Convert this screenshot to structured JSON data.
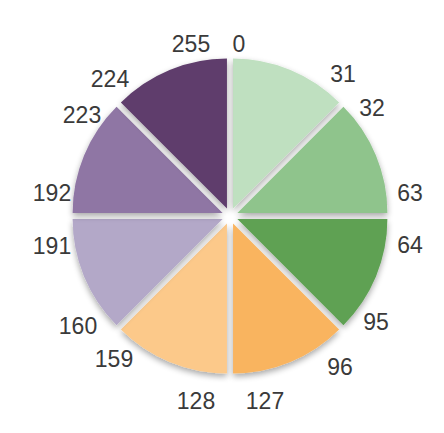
{
  "chart_data": {
    "type": "pie",
    "title": "",
    "center": [
      230,
      216
    ],
    "radius": 150,
    "gap_px": 8,
    "slices": [
      {
        "name": "0-31",
        "start_label": "0",
        "end_label": "31",
        "value": 32,
        "color": "#bfe0c0"
      },
      {
        "name": "32-63",
        "start_label": "32",
        "end_label": "63",
        "value": 32,
        "color": "#8fc48c"
      },
      {
        "name": "64-95",
        "start_label": "64",
        "end_label": "95",
        "value": 32,
        "color": "#5ea152"
      },
      {
        "name": "96-127",
        "start_label": "96",
        "end_label": "127",
        "value": 32,
        "color": "#f9b45f"
      },
      {
        "name": "128-159",
        "start_label": "128",
        "end_label": "159",
        "value": 32,
        "color": "#fcc98a"
      },
      {
        "name": "160-191",
        "start_label": "160",
        "end_label": "191",
        "value": 32,
        "color": "#b3a8c8"
      },
      {
        "name": "192-223",
        "start_label": "192",
        "end_label": "223",
        "value": 32,
        "color": "#8f76a4"
      },
      {
        "name": "224-255",
        "start_label": "224",
        "end_label": "255",
        "value": 32,
        "color": "#5f3e6c"
      }
    ],
    "labels": [
      {
        "text": "0",
        "x": 239,
        "y": 44
      },
      {
        "text": "31",
        "x": 343,
        "y": 74
      },
      {
        "text": "32",
        "x": 372,
        "y": 108
      },
      {
        "text": "63",
        "x": 410,
        "y": 193
      },
      {
        "text": "64",
        "x": 410,
        "y": 245
      },
      {
        "text": "95",
        "x": 376,
        "y": 322
      },
      {
        "text": "96",
        "x": 340,
        "y": 367
      },
      {
        "text": "127",
        "x": 265,
        "y": 401
      },
      {
        "text": "128",
        "x": 196,
        "y": 401
      },
      {
        "text": "159",
        "x": 114,
        "y": 359
      },
      {
        "text": "160",
        "x": 78,
        "y": 326
      },
      {
        "text": "191",
        "x": 52,
        "y": 246
      },
      {
        "text": "192",
        "x": 52,
        "y": 193
      },
      {
        "text": "223",
        "x": 82,
        "y": 115
      },
      {
        "text": "224",
        "x": 110,
        "y": 79
      },
      {
        "text": "255",
        "x": 191,
        "y": 44
      }
    ]
  }
}
